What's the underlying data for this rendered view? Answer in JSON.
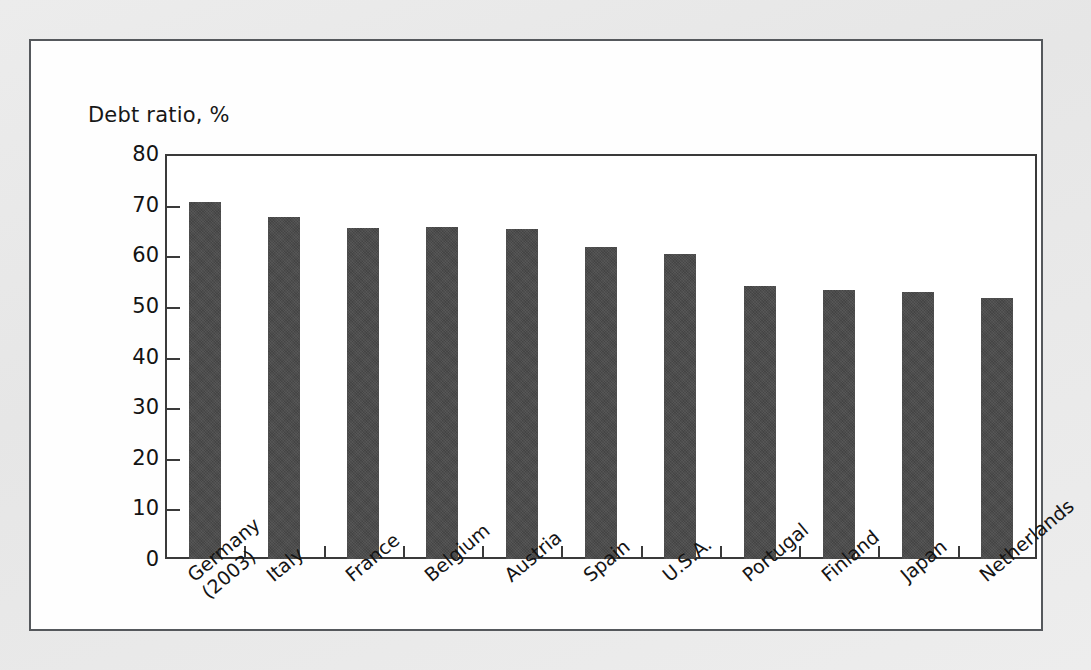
{
  "figure": {
    "background_color": "#e9e9e9",
    "card_background": "#fefefe",
    "card_border_color": "#55585c",
    "axis_color": "#3a3a3a",
    "bar_color": "#4c4c4c"
  },
  "chart_data": {
    "type": "bar",
    "title": "",
    "axis_title": "Debt ratio, %",
    "xlabel": "",
    "ylabel": "Debt ratio, %",
    "ylim": [
      0,
      80
    ],
    "ytick_values": [
      0,
      10,
      20,
      30,
      40,
      50,
      60,
      70,
      80
    ],
    "ytick_labels": [
      "0",
      "10",
      "20",
      "30",
      "40",
      "50",
      "60",
      "70",
      "80"
    ],
    "grid": false,
    "legend": false,
    "categories": [
      "Germany (2003)",
      "Italy",
      "France",
      "Belgium",
      "Austria",
      "Spain",
      "U.S.A.",
      "Portugal",
      "Finland",
      "Japan",
      "Netherlands"
    ],
    "category_lines": [
      [
        "Germany",
        "(2003)"
      ],
      [
        "Italy",
        ""
      ],
      [
        "France",
        ""
      ],
      [
        "Belgium",
        ""
      ],
      [
        "Austria",
        ""
      ],
      [
        "Spain",
        ""
      ],
      [
        "U.S.A.",
        ""
      ],
      [
        "Portugal",
        ""
      ],
      [
        "Finland",
        ""
      ],
      [
        "Japan",
        ""
      ],
      [
        "Netherlands",
        ""
      ]
    ],
    "values": [
      70.5,
      67.5,
      65.3,
      65.5,
      65.1,
      61.6,
      60.3,
      54.0,
      53.2,
      52.8,
      51.6
    ],
    "series": [
      {
        "name": "Debt ratio",
        "values": [
          70.5,
          67.5,
          65.3,
          65.5,
          65.1,
          61.6,
          60.3,
          54.0,
          53.2,
          52.8,
          51.6
        ]
      }
    ]
  }
}
